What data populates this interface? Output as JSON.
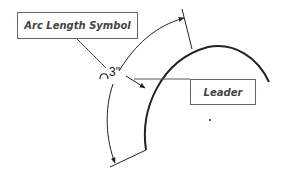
{
  "callouts": {
    "arc_length_symbol": "Arc Length Symbol",
    "leader": "Leader"
  },
  "dimension": {
    "value": "3\""
  },
  "colors": {
    "line": "#222222",
    "box_border": "#666666",
    "label_text": "#444444"
  }
}
